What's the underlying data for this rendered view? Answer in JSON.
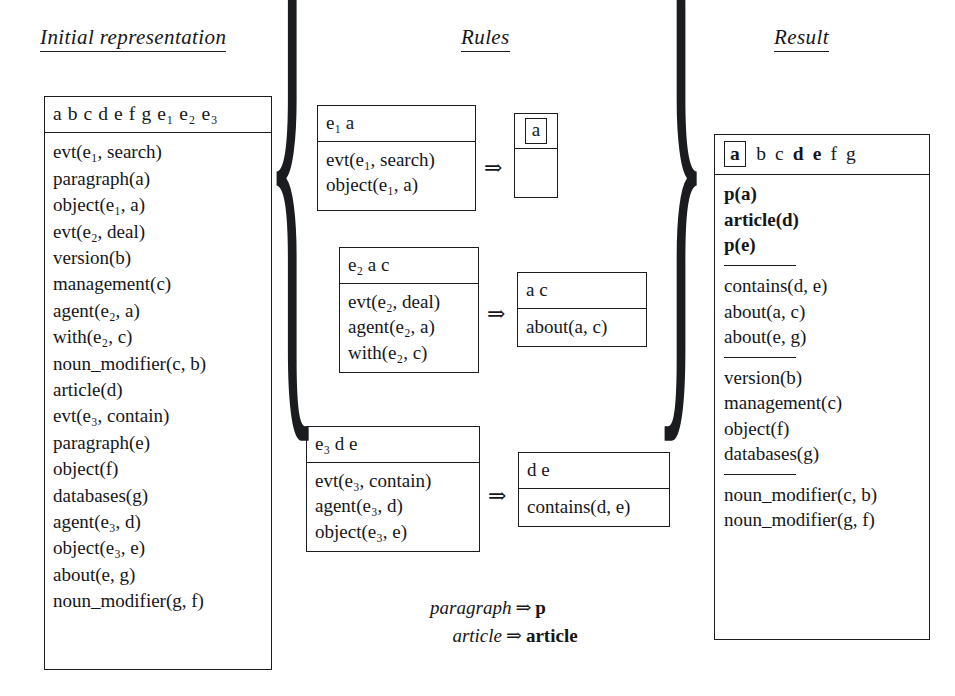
{
  "headings": {
    "initial": "Initial representation",
    "rules": "Rules",
    "result": "Result"
  },
  "initial_representation": {
    "variables": "a b c d e f g e₁ e₂ e₃",
    "facts": [
      "evt(e₁, search)",
      "paragraph(a)",
      "object(e₁, a)",
      "evt(e₂, deal)",
      "version(b)",
      "management(c)",
      "agent(e₂, a)",
      "with(e₂, c)",
      "noun_modifier(c, b)",
      "article(d)",
      "evt(e₃, contain)",
      "paragraph(e)",
      "object(f)",
      "databases(g)",
      "agent(e₃, d)",
      "object(e₃, e)",
      "about(e, g)",
      "noun_modifier(g, f)"
    ]
  },
  "rules": {
    "arrow_glyph": "⇒",
    "items": [
      {
        "lhs_head": "e₁ a",
        "lhs_body": [
          "evt(e₁, search)",
          "object(e₁, a)"
        ],
        "rhs_head_boxed": "a",
        "rhs_body": []
      },
      {
        "lhs_head": "e₂ a c",
        "lhs_body": [
          "evt(e₂, deal)",
          "agent(e₂, a)",
          "with(e₂, c)"
        ],
        "rhs_head": "a c",
        "rhs_body": [
          "about(a, c)"
        ]
      },
      {
        "lhs_head": "e₃ d e",
        "lhs_body": [
          "evt(e₃, contain)",
          "agent(e₃, d)",
          "object(e₃, e)"
        ],
        "rhs_head": "d e",
        "rhs_body": [
          "contains(d, e)"
        ]
      }
    ],
    "lexicon": [
      {
        "source": "paragraph",
        "arrow": "⇒",
        "target": "p"
      },
      {
        "source": "article",
        "arrow": "⇒",
        "target": "article"
      }
    ],
    "brace_left": "{",
    "brace_right": "}"
  },
  "result": {
    "variables": [
      {
        "text": "a",
        "boxed": true,
        "bold": true
      },
      {
        "text": "b",
        "boxed": false,
        "bold": false
      },
      {
        "text": "c",
        "boxed": false,
        "bold": false
      },
      {
        "text": "d",
        "boxed": false,
        "bold": true
      },
      {
        "text": "e",
        "boxed": false,
        "bold": true
      },
      {
        "text": "f",
        "boxed": false,
        "bold": false
      },
      {
        "text": "g",
        "boxed": false,
        "bold": false
      }
    ],
    "groups": [
      {
        "bold": true,
        "lines": [
          "p(a)",
          "article(d)",
          "p(e)"
        ]
      },
      {
        "bold": false,
        "lines": [
          "contains(d, e)",
          "about(a, c)",
          "about(e, g)"
        ]
      },
      {
        "bold": false,
        "lines": [
          "version(b)",
          "management(c)",
          "object(f)",
          "databases(g)"
        ]
      },
      {
        "bold": false,
        "lines": [
          "noun_modifier(c, b)",
          "noun_modifier(g, f)"
        ]
      }
    ]
  }
}
